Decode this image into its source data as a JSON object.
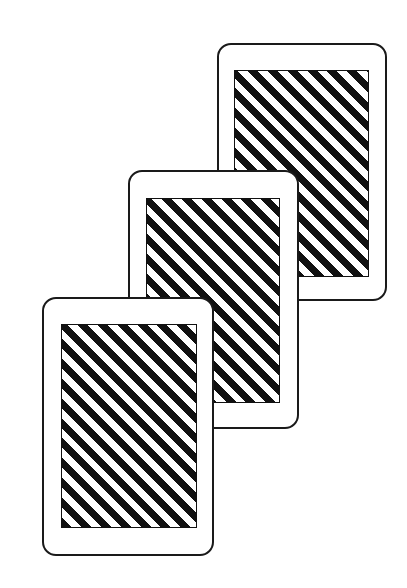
{
  "scene": {
    "description": "Three overlapping playing cards, face down, with diagonal black-and-white striped backs",
    "background": "#ffffff",
    "stroke": "#1a1a1a",
    "stripe_colors": [
      "#111111",
      "#ffffff"
    ]
  },
  "cards": [
    {
      "id": "card-front",
      "outer": {
        "x": 42,
        "y": 297,
        "w": 172,
        "h": 259
      },
      "inner": {
        "x": 61,
        "y": 324,
        "w": 136,
        "h": 204
      }
    },
    {
      "id": "card-middle",
      "outer": {
        "x": 128,
        "y": 170,
        "w": 171,
        "h": 259
      },
      "inner": {
        "x": 146,
        "y": 198,
        "w": 134,
        "h": 205
      }
    },
    {
      "id": "card-back",
      "outer": {
        "x": 217,
        "y": 43,
        "w": 170,
        "h": 258
      },
      "inner": {
        "x": 234,
        "y": 70,
        "w": 135,
        "h": 207
      }
    }
  ]
}
